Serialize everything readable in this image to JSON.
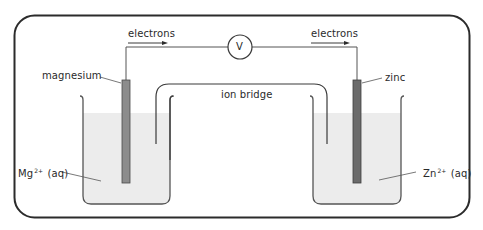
{
  "diagram": {
    "labels": {
      "electrons_left": "electrons",
      "electrons_right": "electrons",
      "voltmeter": "V",
      "magnesium": "magnesium",
      "zinc": "zinc",
      "ion_bridge": "ion bridge",
      "mg_ion_base": "Mg",
      "mg_ion_charge": "2+",
      "mg_ion_state": "(aq)",
      "zn_ion_base": "Zn",
      "zn_ion_charge": "2+",
      "zn_ion_state": "(aq)"
    },
    "colors": {
      "frame": "#2b2b2b",
      "line": "#3a3a3a",
      "solution": "#ececec",
      "magnesium_electrode": "#8c8c8c",
      "zinc_electrode": "#6b6b6b",
      "background": "#ffffff"
    }
  }
}
